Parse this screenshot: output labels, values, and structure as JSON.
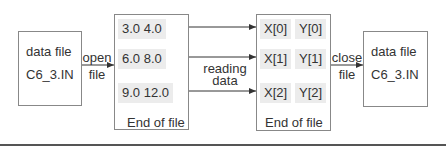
{
  "source_file": {
    "line1": "data file",
    "line2": "C6_3.IN"
  },
  "open_label": {
    "line1": "open",
    "line2": "file"
  },
  "file_contents": {
    "rows": [
      "3.0  4.0",
      "6.0  8.0",
      "9.0  12.0"
    ],
    "eof": "End of file"
  },
  "reading_label": {
    "line1": "reading",
    "line2": "data"
  },
  "arrays": {
    "rows": [
      {
        "x": "X[0]",
        "y": "Y[0]"
      },
      {
        "x": "X[1]",
        "y": "Y[1]"
      },
      {
        "x": "X[2]",
        "y": "Y[2]"
      }
    ],
    "eof": "End of file"
  },
  "close_label": {
    "line1": "close",
    "line2": "file"
  },
  "dest_file": {
    "line1": "data file",
    "line2": "C6_3.IN"
  }
}
